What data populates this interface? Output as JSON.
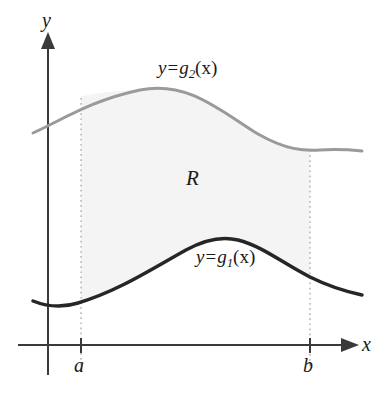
{
  "figure": {
    "axes": {
      "y_axis_label": "y",
      "x_axis_label": "x",
      "origin_x_px": 48,
      "origin_y_px": 345,
      "axis_color": "#3a3a3a"
    },
    "bounds": {
      "left_tick_label": "a",
      "right_tick_label": "b",
      "left_tick_x_px": 81,
      "right_tick_x_px": 310,
      "guide_style": "dotted",
      "guide_color": "#b9b9b9"
    },
    "region": {
      "label": "R",
      "fill_color": "#f4f4f4"
    },
    "curves": [
      {
        "name": "upper-curve",
        "label_prefix": "y",
        "label_eq": "=",
        "label_fn": "g",
        "label_sub": "2",
        "label_arg": "(x)",
        "color": "#9a9a9a",
        "stroke_width": 3,
        "path": "M 33 133 C 62 120, 92 100, 140 90 C 188 80, 222 112, 258 134 C 286 150, 304 151, 320 150 C 338 149, 352 150, 362 151"
      },
      {
        "name": "lower-curve",
        "label_prefix": "y",
        "label_eq": "=",
        "label_fn": "g",
        "label_sub": "1",
        "label_arg": "(x)",
        "color": "#262626",
        "stroke_width": 3.5,
        "path": "M 33 301 C 48 307, 62 308, 78 303 C 118 291, 150 270, 186 250 C 206 239, 222 236, 238 240 C 262 246, 284 264, 310 277 C 332 288, 348 292, 362 295"
      }
    ],
    "ghost_text": {
      "line1": "the contour",
      "line2": "a a a a a a",
      "line3": "a an a a a a an",
      "line4": "works in the base"
    }
  }
}
